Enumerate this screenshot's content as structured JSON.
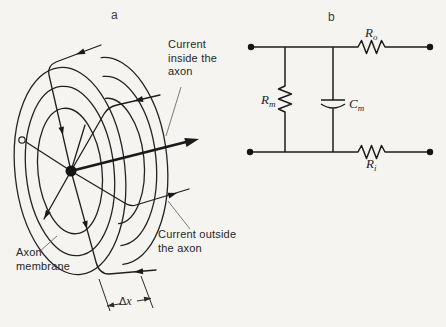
{
  "figure": {
    "background": "#f5f4f1",
    "ink": "#1f1f1f"
  },
  "panel_a": {
    "caption": "a",
    "labels": {
      "current_inside": "Current\ninside the\naxon",
      "current_outside": "Current outside\nthe axon",
      "axon_membrane": "Axon\nmembrane",
      "delta_x_delta": "Δ",
      "delta_x_var": "x"
    }
  },
  "panel_b": {
    "caption": "b",
    "components": {
      "r_o": {
        "base": "R",
        "sub": "o"
      },
      "r_m": {
        "base": "R",
        "sub": "m"
      },
      "c_m": {
        "base": "C",
        "sub": "m"
      },
      "r_i": {
        "base": "R",
        "sub": "i"
      }
    }
  }
}
